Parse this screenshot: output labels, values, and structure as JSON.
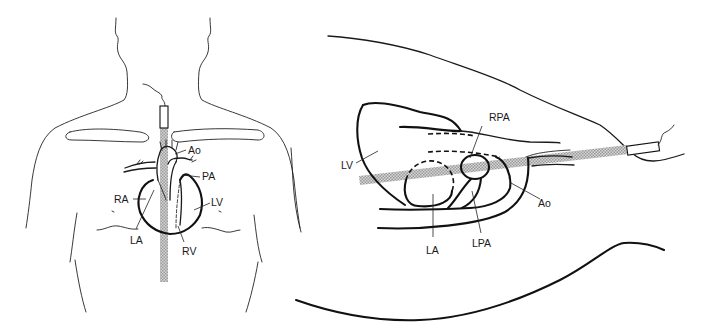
{
  "figure": {
    "panels": [
      {
        "id": "frontal-view",
        "description": "Anterior chest view with suprasternal transducer and ultrasound beam",
        "labels": {
          "ao": "Ao",
          "pa": "PA",
          "ra": "RA",
          "lv": "LV",
          "la": "LA",
          "rv": "RV"
        }
      },
      {
        "id": "sagittal-view",
        "description": "Lateral view with suprasternal transducer beam crossing heart structures",
        "labels": {
          "lv": "LV",
          "rpa": "RPA",
          "ao": "Ao",
          "la": "LA",
          "lpa": "LPA"
        }
      }
    ],
    "colors": {
      "line": "#1a1a1a",
      "beam": "#b8b8b8",
      "background": "#ffffff"
    }
  }
}
